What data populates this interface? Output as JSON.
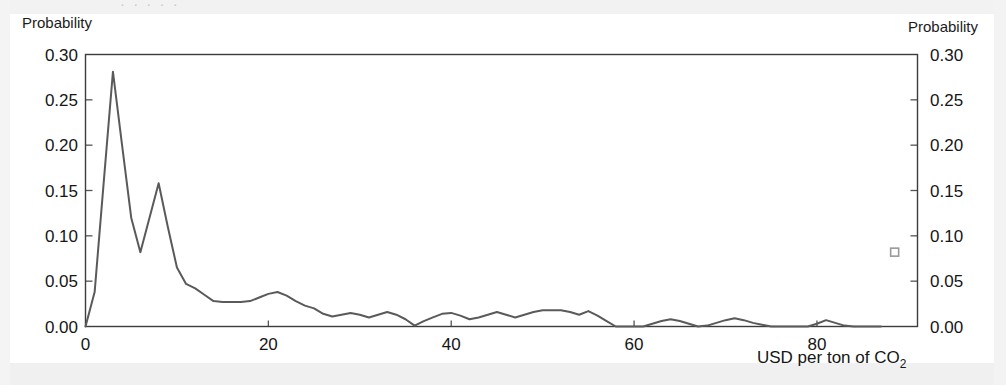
{
  "page": {
    "title_ghost": "· ·  ·    ·   ·"
  },
  "chart_data": {
    "type": "line",
    "title": "",
    "xlabel": "USD per ton of CO",
    "xlabel_sub": "2",
    "ylabel_left": "Probability",
    "ylabel_right": "Probability",
    "xlim": [
      0,
      91
    ],
    "ylim": [
      0.0,
      0.3
    ],
    "grid": false,
    "legend": false,
    "xticks": [
      0,
      20,
      40,
      60,
      80
    ],
    "xtick_labels": [
      "0",
      "20",
      "40",
      "60",
      "80"
    ],
    "yticks": [
      0.0,
      0.05,
      0.1,
      0.15,
      0.2,
      0.25,
      0.3
    ],
    "ytick_labels": [
      "0.00",
      "0.05",
      "0.10",
      "0.15",
      "0.20",
      "0.25",
      "0.30"
    ],
    "ytick_labels_right": [
      "0.00",
      "0.05",
      "0.10",
      "0.15",
      "0.20",
      "0.25",
      "0.30"
    ],
    "series": [
      {
        "name": "Probability distribution",
        "color": "#5a5a5a",
        "x": [
          0,
          1,
          2,
          3,
          4,
          5,
          6,
          7,
          8,
          9,
          10,
          11,
          12,
          13,
          14,
          15,
          16,
          17,
          18,
          19,
          20,
          21,
          22,
          23,
          24,
          25,
          26,
          27,
          28,
          29,
          30,
          31,
          32,
          33,
          34,
          35,
          36,
          37,
          38,
          39,
          40,
          41,
          42,
          43,
          44,
          45,
          46,
          47,
          48,
          49,
          50,
          51,
          52,
          53,
          54,
          55,
          56,
          57,
          58,
          59,
          60,
          61,
          62,
          63,
          64,
          65,
          66,
          67,
          68,
          69,
          70,
          71,
          72,
          73,
          74,
          75,
          76,
          77,
          78,
          79,
          80,
          81,
          82,
          83,
          84,
          85,
          86,
          87
        ],
        "y": [
          0.0,
          0.038,
          0.16,
          0.281,
          0.2,
          0.12,
          0.082,
          0.12,
          0.158,
          0.11,
          0.065,
          0.047,
          0.042,
          0.035,
          0.028,
          0.027,
          0.027,
          0.027,
          0.028,
          0.032,
          0.036,
          0.038,
          0.034,
          0.028,
          0.023,
          0.02,
          0.014,
          0.011,
          0.013,
          0.015,
          0.013,
          0.01,
          0.013,
          0.016,
          0.013,
          0.008,
          0.001,
          0.006,
          0.01,
          0.014,
          0.015,
          0.012,
          0.008,
          0.01,
          0.013,
          0.016,
          0.013,
          0.01,
          0.013,
          0.016,
          0.018,
          0.018,
          0.018,
          0.016,
          0.013,
          0.017,
          0.012,
          0.006,
          0.0,
          0.0,
          0.0,
          0.0,
          0.003,
          0.006,
          0.008,
          0.006,
          0.003,
          0.0,
          0.001,
          0.004,
          0.007,
          0.009,
          0.007,
          0.004,
          0.002,
          0.0,
          0.0,
          0.0,
          0.0,
          0.0,
          0.003,
          0.007,
          0.004,
          0.001,
          0.0,
          0.0,
          0.0,
          0.0
        ]
      }
    ],
    "annotations": [
      {
        "name": "scan-speck",
        "shape": "open-square",
        "x": 88.5,
        "y": 0.082
      }
    ]
  }
}
